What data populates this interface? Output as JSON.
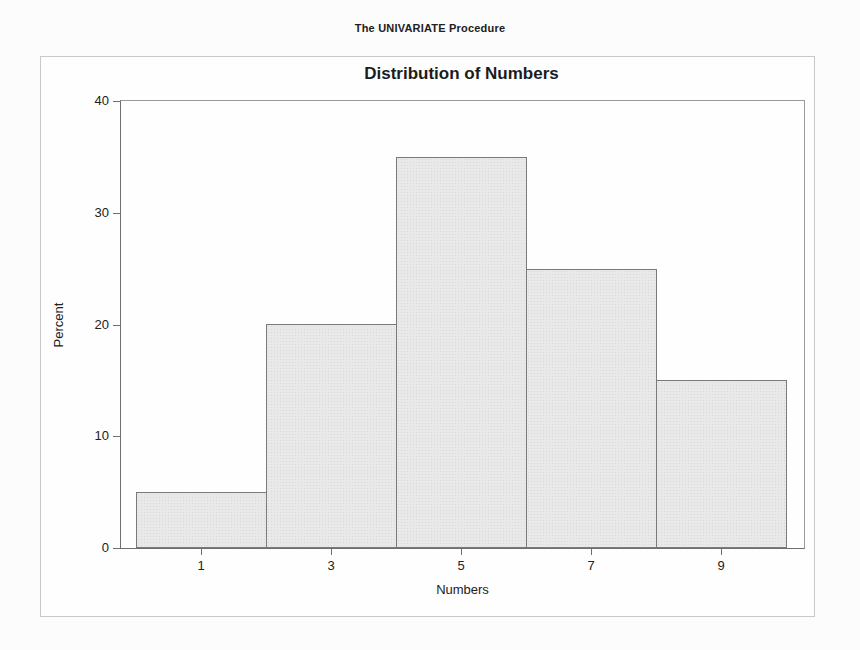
{
  "page": {
    "procedure_title": "The UNIVARIATE Procedure"
  },
  "chart_data": {
    "type": "bar",
    "subtype": "histogram",
    "title": "Distribution of Numbers",
    "xlabel": "Numbers",
    "ylabel": "Percent",
    "categories": [
      1,
      3,
      5,
      7,
      9
    ],
    "values": [
      5,
      20,
      35,
      25,
      15
    ],
    "y_ticks": [
      0,
      10,
      20,
      30,
      40
    ],
    "ylim": [
      0,
      40
    ],
    "x_range": [
      0,
      10
    ],
    "bin_width": 2,
    "grid": false,
    "legend": "none",
    "colors": {
      "background": "#fcfcfc",
      "outer_border": "#c9c9c9",
      "frame": "#9a9a9a",
      "axis": "#6f6f6f",
      "bar_fill": "#e9e9e9",
      "bar_dot": "#d9d9d9",
      "bar_border": "#7a7a7a",
      "text": "#212121"
    }
  }
}
